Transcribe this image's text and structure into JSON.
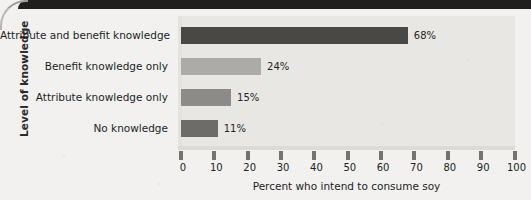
{
  "chart_data": {
    "type": "bar",
    "orientation": "horizontal",
    "title": "",
    "xlabel": "Percent who intend to consume soy",
    "ylabel": "Level of knowledge",
    "categories": [
      "Attribute and benefit knowledge",
      "Benefit knowledge only",
      "Attribute knowledge only",
      "No knowledge"
    ],
    "values": [
      68,
      24,
      15,
      11
    ],
    "value_labels": [
      "68%",
      "24%",
      "15%",
      "11%"
    ],
    "bar_colors": [
      "#4a4846",
      "#adaba7",
      "#8d8b87",
      "#6e6c69"
    ],
    "xlim": [
      0,
      100
    ],
    "xticks": [
      0,
      10,
      20,
      30,
      40,
      50,
      60,
      70,
      80,
      90,
      100
    ],
    "xtick_labels": [
      "0",
      "10",
      "20",
      "30",
      "40",
      "50",
      "60",
      "70",
      "80",
      "90",
      "100"
    ],
    "grid": false,
    "legend": null,
    "plot_background": "#e8e7e4",
    "page_background": "#f2f1ef"
  }
}
